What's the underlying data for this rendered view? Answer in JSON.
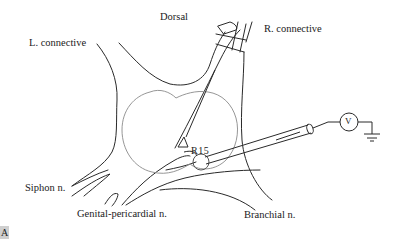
{
  "figure": {
    "panel_label": "A",
    "labels": {
      "dorsal": "Dorsal",
      "left_connective": "L. connective",
      "right_connective": "R. connective",
      "siphon_nerve": "Siphon n.",
      "genital_pericardial_nerve": "Genital-pericardial n.",
      "branchial_nerve": "Branchial n.",
      "neuron": "R15",
      "voltmeter": "V"
    },
    "colors": {
      "outline": "#2a2a2a",
      "ganglion_inner": "#8a8a8a",
      "background": "#ffffff",
      "panel_tag_bg": "#cfcfcf"
    }
  }
}
